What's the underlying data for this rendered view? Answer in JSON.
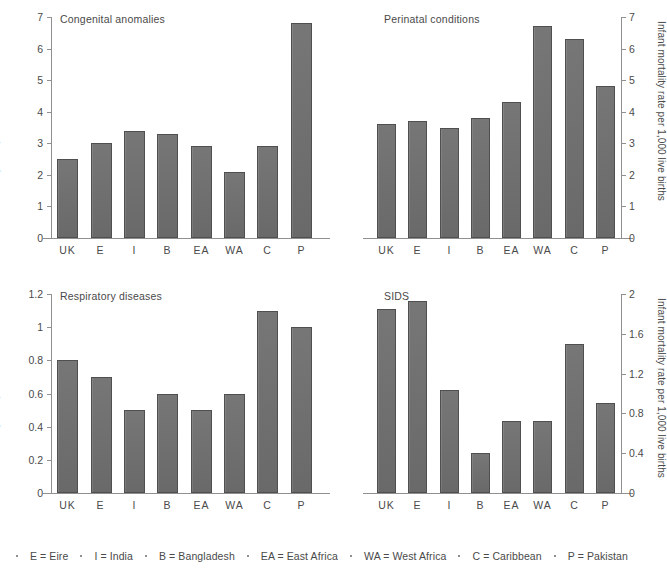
{
  "figure": {
    "background": "#ffffff",
    "bar_color": "#6f6f6f",
    "axis_color": "#909090",
    "text_color": "#4a4a4a"
  },
  "categories": [
    "UK",
    "E",
    "I",
    "B",
    "EA",
    "WA",
    "C",
    "P"
  ],
  "legend": {
    "items": [
      "E = Eire",
      "I = India",
      "B = Bangladesh",
      "EA = East Africa",
      "WA = West Africa",
      "C = Caribbean",
      "P = Pakistan"
    ]
  },
  "chart_data": [
    {
      "type": "bar",
      "title": "Congenital anomalies",
      "panel": "top-left",
      "xlabel": "",
      "ylabel": "Infant mortality rate per 1,000 live births",
      "ylabel_position": "left",
      "categories": [
        "UK",
        "E",
        "I",
        "B",
        "EA",
        "WA",
        "C",
        "P"
      ],
      "values": [
        2.5,
        3.0,
        3.4,
        3.3,
        2.9,
        2.1,
        2.9,
        6.8
      ],
      "ylim": [
        0,
        7
      ],
      "yticks": [
        0,
        1,
        2,
        3,
        4,
        5,
        6,
        7
      ],
      "ytick_labels": [
        "0",
        "1",
        "2",
        "3",
        "4",
        "5",
        "6",
        "7"
      ],
      "grid": false,
      "legend_position": "none"
    },
    {
      "type": "bar",
      "title": "Perinatal conditions",
      "panel": "top-right",
      "xlabel": "",
      "ylabel": "Infant mortality rate per 1,000 live births",
      "ylabel_position": "right",
      "categories": [
        "UK",
        "E",
        "I",
        "B",
        "EA",
        "WA",
        "C",
        "P"
      ],
      "values": [
        3.6,
        3.7,
        3.5,
        3.8,
        4.3,
        6.7,
        6.3,
        4.8
      ],
      "ylim": [
        0,
        7
      ],
      "yticks": [
        0,
        1,
        2,
        3,
        4,
        5,
        6,
        7
      ],
      "ytick_labels": [
        "0",
        "1",
        "2",
        "3",
        "4",
        "5",
        "6",
        "7"
      ],
      "grid": false,
      "legend_position": "none"
    },
    {
      "type": "bar",
      "title": "Respiratory diseases",
      "panel": "bottom-left",
      "xlabel": "",
      "ylabel": "Infant mortality rate per 1,000 live births",
      "ylabel_position": "left",
      "categories": [
        "UK",
        "E",
        "I",
        "B",
        "EA",
        "WA",
        "C",
        "P"
      ],
      "values": [
        0.8,
        0.7,
        0.5,
        0.6,
        0.5,
        0.6,
        1.1,
        1.0
      ],
      "ylim": [
        0,
        1.2
      ],
      "yticks": [
        0,
        0.2,
        0.4,
        0.6,
        0.8,
        1,
        1.2
      ],
      "ytick_labels": [
        "0",
        "0.2",
        "0.4",
        "0.6",
        "0.8",
        "1",
        "1.2"
      ],
      "grid": false,
      "legend_position": "none"
    },
    {
      "type": "bar",
      "title": "SIDS",
      "panel": "bottom-right",
      "xlabel": "",
      "ylabel": "Infant mortality rate per 1,000 live births",
      "ylabel_position": "right",
      "categories": [
        "UK",
        "E",
        "I",
        "B",
        "EA",
        "WA",
        "C",
        "P"
      ],
      "values": [
        1.85,
        1.93,
        1.04,
        0.4,
        0.72,
        0.72,
        1.5,
        0.9
      ],
      "ylim": [
        0,
        2
      ],
      "yticks": [
        0,
        0.4,
        0.8,
        1.2,
        1.6,
        2
      ],
      "ytick_labels": [
        "0",
        "0.4",
        "0.8",
        "1.2",
        "1.6",
        "2"
      ],
      "grid": false,
      "legend_position": "none"
    }
  ]
}
